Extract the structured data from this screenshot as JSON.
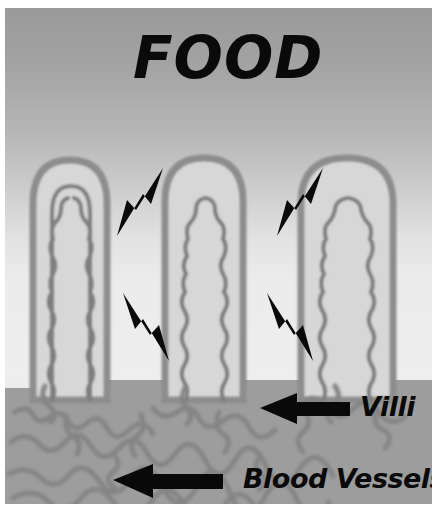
{
  "figure": {
    "kind": "biology-diagram",
    "title": "FOOD",
    "palette": {
      "paper": "#ffffff",
      "lumen_top": "#9a9a9a",
      "lumen_bottom": "#eeeeee",
      "tissue": "#9d9d9d",
      "villus_fill": "#d9d9d9",
      "villus_outline": "#8e8e8e",
      "capillary": "#7d7d7d",
      "vessel": "#828282",
      "ink": "#0a0a0a"
    },
    "labels": {
      "villi": "Villi",
      "blood_vessels": "Blood Vessels"
    },
    "arrows": {
      "food_flow_count": 4,
      "pointer_count": 2,
      "food_flow": [
        {
          "name": "food-arrow-upper-left",
          "direction": "down-left"
        },
        {
          "name": "food-arrow-upper-right",
          "direction": "down-left"
        },
        {
          "name": "food-arrow-lower-left",
          "direction": "down-right"
        },
        {
          "name": "food-arrow-lower-right",
          "direction": "down-right"
        }
      ],
      "pointers": [
        {
          "name": "villi-pointer-arrow",
          "direction": "left",
          "targets": "Villi"
        },
        {
          "name": "blood-vessels-pointer-arrow",
          "direction": "left",
          "targets": "Blood Vessels"
        }
      ]
    },
    "villi": [
      {
        "name": "villus-left",
        "tip_y": 160,
        "base_y": 392,
        "width": 74
      },
      {
        "name": "villus-middle",
        "tip_y": 158,
        "base_y": 392,
        "width": 78
      },
      {
        "name": "villus-right",
        "tip_y": 158,
        "base_y": 392,
        "width": 92
      }
    ]
  }
}
